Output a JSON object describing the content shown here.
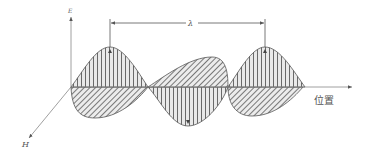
{
  "diagram": {
    "labels": {
      "e_axis": "E",
      "h_axis": "H",
      "position_axis": "位置",
      "wavelength": "λ"
    },
    "colors": {
      "stroke": "#555555",
      "hatch": "#666666",
      "fill": "#e6e6e6",
      "background": "#ffffff"
    },
    "elements": [
      {
        "id": "e-field",
        "description": "vertical-hatched lobes in vertical plane (E field)"
      },
      {
        "id": "h-field",
        "description": "diagonal-hatched lobes in horizontal plane (H field)"
      },
      {
        "id": "wavelength-marker",
        "description": "dimension arrow spanning one wavelength between two crests"
      }
    ]
  }
}
